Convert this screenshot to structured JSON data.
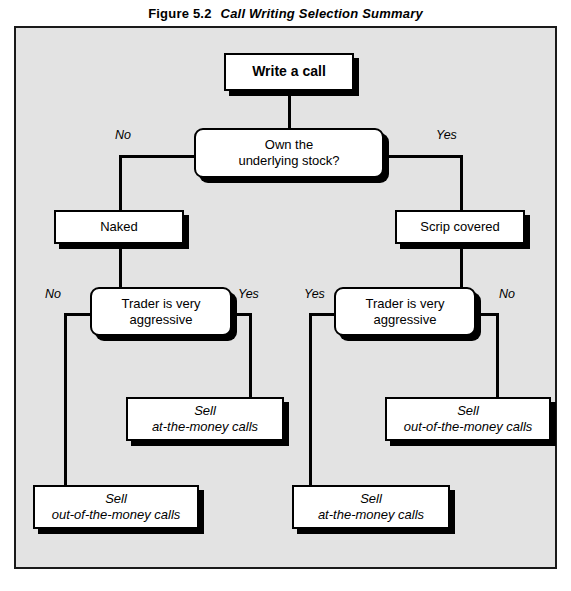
{
  "figure": {
    "number": "Figure 5.2",
    "caption": "Call Writing Selection Summary"
  },
  "colors": {
    "panel_background": "#e3e3e3",
    "node_fill": "#ffffff",
    "stroke": "#000000",
    "shadow": "#000000"
  },
  "nodes": {
    "start": {
      "label": "Write a call",
      "shape": "rect",
      "emphasis": "bold"
    },
    "decision_own_stock": {
      "line1": "Own the",
      "line2": "underlying stock?",
      "shape": "rounded"
    },
    "naked": {
      "label": "Naked",
      "shape": "rect"
    },
    "scrip_covered": {
      "label": "Scrip covered",
      "shape": "rect"
    },
    "decision_aggressive_left": {
      "line1": "Trader is very",
      "line2": "aggressive",
      "shape": "rounded"
    },
    "decision_aggressive_right": {
      "line1": "Trader is very",
      "line2": "aggressive",
      "shape": "rounded"
    },
    "outcome_left_yes": {
      "line1": "Sell",
      "line2": "at-the-money calls",
      "shape": "rect",
      "emphasis": "italic"
    },
    "outcome_left_no": {
      "line1": "Sell",
      "line2": "out-of-the-money calls",
      "shape": "rect",
      "emphasis": "italic"
    },
    "outcome_right_yes": {
      "line1": "Sell",
      "line2": "at-the-money calls",
      "shape": "rect",
      "emphasis": "italic"
    },
    "outcome_right_no": {
      "line1": "Sell",
      "line2": "out-of-the-money calls",
      "shape": "rect",
      "emphasis": "italic"
    }
  },
  "branch_labels": {
    "own_stock_no": "No",
    "own_stock_yes": "Yes",
    "left_aggressive_no": "No",
    "left_aggressive_yes": "Yes",
    "right_aggressive_yes": "Yes",
    "right_aggressive_no": "No"
  }
}
